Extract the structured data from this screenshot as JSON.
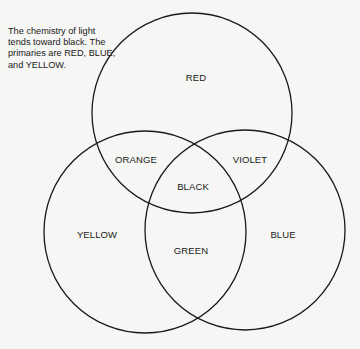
{
  "caption": "The chemistry of light tends toward black. The primaries are RED, BLUE, and YELLOW.",
  "circles": {
    "red": {
      "label": "RED"
    },
    "yellow": {
      "label": "YELLOW"
    },
    "blue": {
      "label": "BLUE"
    }
  },
  "overlaps": {
    "red_yellow": "ORANGE",
    "red_blue": "VIOLET",
    "yellow_blue": "GREEN",
    "all": "BLACK"
  },
  "colors": {
    "line": "#1a1a1a",
    "background": "#f6f6f4"
  }
}
